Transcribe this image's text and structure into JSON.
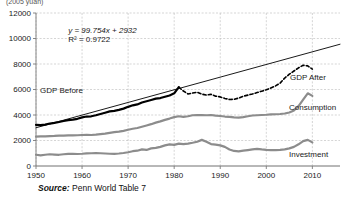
{
  "chart_data": {
    "type": "line",
    "title": "",
    "axis_title_top": "(2005 yuan)",
    "xlabel": "",
    "ylabel": "",
    "xlim": [
      1950,
      2016
    ],
    "ylim": [
      0,
      12000
    ],
    "x_ticks": [
      "1950",
      "1960",
      "1970",
      "1980",
      "1990",
      "2000",
      "2010"
    ],
    "x_tick_values": [
      1950,
      1960,
      1970,
      1980,
      1990,
      2000,
      2010
    ],
    "y_ticks": [
      "0",
      "2000",
      "4000",
      "6000",
      "8000",
      "10000",
      "12000"
    ],
    "y_tick_values": [
      0,
      2000,
      4000,
      6000,
      8000,
      10000,
      12000
    ],
    "grid": true,
    "legend_position": "inline-labels",
    "annotations": [
      {
        "name": "trend-equation",
        "text": "y = 99.754x + 2932",
        "x": 1957,
        "y": 10450
      },
      {
        "name": "trend-r2",
        "text": "R² = 0.9722",
        "x": 1957,
        "y": 9700
      }
    ],
    "series": [
      {
        "name": "GDP Before",
        "label": "GDP Before",
        "color": "#000000",
        "style": "solid",
        "width": 2.2,
        "x": [
          1950,
          1951,
          1952,
          1953,
          1954,
          1955,
          1956,
          1957,
          1958,
          1959,
          1960,
          1961,
          1962,
          1963,
          1964,
          1965,
          1966,
          1967,
          1968,
          1969,
          1970,
          1971,
          1972,
          1973,
          1974,
          1975,
          1976,
          1977,
          1978,
          1979,
          1980,
          1981
        ],
        "values": [
          3230,
          3200,
          3250,
          3330,
          3380,
          3450,
          3530,
          3600,
          3640,
          3700,
          3810,
          3880,
          3900,
          3980,
          4080,
          4180,
          4280,
          4320,
          4400,
          4500,
          4640,
          4760,
          4830,
          4980,
          5080,
          5180,
          5280,
          5330,
          5430,
          5530,
          5700,
          6180
        ]
      },
      {
        "name": "GDP After",
        "label": "GDP After",
        "color": "#000000",
        "style": "dashed",
        "width": 1.6,
        "x": [
          1981,
          1982,
          1983,
          1984,
          1985,
          1986,
          1987,
          1988,
          1989,
          1990,
          1991,
          1992,
          1993,
          1994,
          1995,
          1996,
          1997,
          1998,
          1999,
          2000,
          2001,
          2002,
          2003,
          2004,
          2005,
          2006,
          2007,
          2008,
          2009,
          2010
        ],
        "values": [
          6180,
          5880,
          5650,
          5720,
          5790,
          5640,
          5560,
          5620,
          5480,
          5420,
          5300,
          5220,
          5230,
          5330,
          5470,
          5560,
          5650,
          5760,
          5870,
          5980,
          6120,
          6280,
          6500,
          6900,
          7200,
          7450,
          7700,
          7900,
          7850,
          7600
        ]
      },
      {
        "name": "Trend Line",
        "label": "",
        "color": "#000000",
        "style": "solid",
        "width": 0.9,
        "x": [
          1950,
          2016
        ],
        "values": [
          3000,
          9550
        ]
      },
      {
        "name": "Consumption",
        "label": "Consumption",
        "color": "#8c8c8c",
        "style": "solid",
        "width": 2.2,
        "x": [
          1950,
          1951,
          1952,
          1953,
          1954,
          1955,
          1956,
          1957,
          1958,
          1959,
          1960,
          1961,
          1962,
          1963,
          1964,
          1965,
          1966,
          1967,
          1968,
          1969,
          1970,
          1971,
          1972,
          1973,
          1974,
          1975,
          1976,
          1977,
          1978,
          1979,
          1980,
          1981,
          1982,
          1983,
          1984,
          1985,
          1986,
          1987,
          1988,
          1989,
          1990,
          1991,
          1992,
          1993,
          1994,
          1995,
          1996,
          1997,
          1998,
          1999,
          2000,
          2001,
          2002,
          2003,
          2004,
          2005,
          2006,
          2007,
          2008,
          2009,
          2010
        ],
        "values": [
          2300,
          2320,
          2330,
          2350,
          2360,
          2380,
          2390,
          2400,
          2400,
          2410,
          2430,
          2440,
          2430,
          2460,
          2500,
          2540,
          2600,
          2650,
          2700,
          2760,
          2840,
          2920,
          2980,
          3080,
          3180,
          3280,
          3400,
          3500,
          3620,
          3720,
          3830,
          3900,
          3850,
          3900,
          3980,
          4000,
          3990,
          3980,
          4000,
          3950,
          3920,
          3880,
          3850,
          3820,
          3800,
          3840,
          3900,
          3960,
          3980,
          4000,
          4020,
          4050,
          4060,
          4080,
          4120,
          4200,
          4350,
          4700,
          5200,
          5700,
          5500
        ]
      },
      {
        "name": "Investment",
        "label": "Investment",
        "color": "#8c8c8c",
        "style": "solid",
        "width": 2.2,
        "x": [
          1950,
          1951,
          1952,
          1953,
          1954,
          1955,
          1956,
          1957,
          1958,
          1959,
          1960,
          1961,
          1962,
          1963,
          1964,
          1965,
          1966,
          1967,
          1968,
          1969,
          1970,
          1971,
          1972,
          1973,
          1974,
          1975,
          1976,
          1977,
          1978,
          1979,
          1980,
          1981,
          1982,
          1983,
          1984,
          1985,
          1986,
          1987,
          1988,
          1989,
          1990,
          1991,
          1992,
          1993,
          1994,
          1995,
          1996,
          1997,
          1998,
          1999,
          2000,
          2001,
          2002,
          2003,
          2004,
          2005,
          2006,
          2007,
          2008,
          2009,
          2010
        ],
        "values": [
          880,
          840,
          880,
          920,
          900,
          880,
          920,
          950,
          960,
          940,
          960,
          990,
          1000,
          1010,
          1000,
          980,
          960,
          950,
          980,
          1020,
          1080,
          1160,
          1200,
          1300,
          1260,
          1380,
          1420,
          1500,
          1620,
          1700,
          1660,
          1750,
          1720,
          1760,
          1820,
          1900,
          2050,
          1900,
          1720,
          1680,
          1620,
          1500,
          1300,
          1180,
          1150,
          1200,
          1250,
          1300,
          1350,
          1300,
          1260,
          1250,
          1240,
          1260,
          1300,
          1380,
          1500,
          1700,
          1950,
          2050,
          1850
        ]
      }
    ],
    "source": {
      "prefix": "Source:",
      "text": "Penn World Table 7"
    }
  }
}
